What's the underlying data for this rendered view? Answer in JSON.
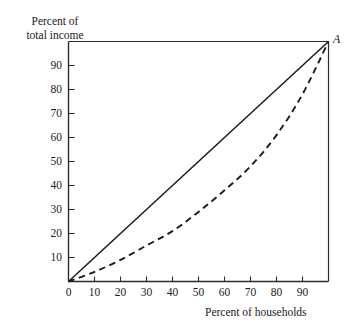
{
  "chart_data": {
    "type": "line",
    "title": "",
    "xlabel": "Percent of households",
    "ylabel": "Percent of\ntotal income",
    "ylabel_line1": "Percent of",
    "ylabel_line2": "total income",
    "xlim": [
      0,
      100
    ],
    "ylim": [
      0,
      100
    ],
    "grid": false,
    "legend": "none",
    "xticks": [
      0,
      10,
      20,
      30,
      40,
      50,
      60,
      70,
      80,
      90
    ],
    "xtick_labels": [
      "0",
      "10",
      "20",
      "30",
      "40",
      "50",
      "60",
      "70",
      "80",
      "90"
    ],
    "yticks": [
      10,
      20,
      30,
      40,
      50,
      60,
      70,
      80,
      90
    ],
    "ytick_labels": [
      "10",
      "20",
      "30",
      "40",
      "50",
      "60",
      "70",
      "80",
      "90"
    ],
    "annotations": [
      {
        "text": "A",
        "x": 100,
        "y": 100,
        "style": "italic"
      }
    ],
    "series": [
      {
        "name": "line of equality",
        "style": "solid",
        "color": "#1a1a1a",
        "x": [
          0,
          100
        ],
        "values": [
          0,
          100
        ]
      },
      {
        "name": "Lorenz curve",
        "style": "dashed",
        "color": "#1a1a1a",
        "x": [
          0,
          10,
          20,
          30,
          40,
          50,
          60,
          70,
          80,
          90,
          100
        ],
        "values": [
          0,
          4,
          9,
          15,
          21,
          29,
          38,
          48,
          61,
          78,
          100
        ]
      }
    ]
  },
  "axes": {
    "y_title_line1": "Percent of",
    "y_title_line2": "total income",
    "x_title": "Percent of households",
    "point_a": "A"
  }
}
